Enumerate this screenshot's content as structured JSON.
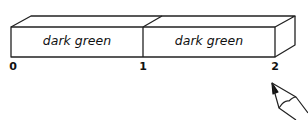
{
  "diagram": {
    "segments": [
      {
        "label": "dark green",
        "start": 0,
        "end": 1
      },
      {
        "label": "dark green",
        "start": 1,
        "end": 2
      }
    ],
    "ticks": [
      "0",
      "1",
      "2"
    ],
    "pointer": "pencil-icon"
  }
}
